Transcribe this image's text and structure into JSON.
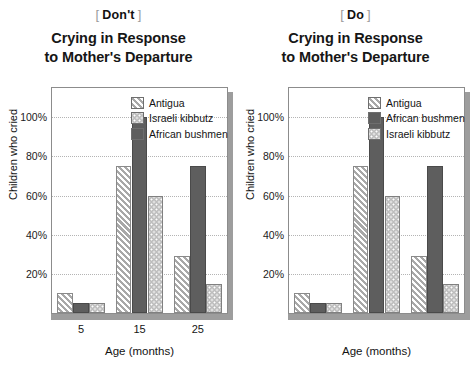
{
  "panels": [
    {
      "tag": {
        "open_bracket": "[",
        "word": "Don't",
        "close_bracket": "]"
      },
      "title_line1": "Crying in Response",
      "title_line2": "to Mother's Departure",
      "legend_order": [
        "Antigua",
        "Israeli kibbutz",
        "African bushmen"
      ]
    },
    {
      "tag": {
        "open_bracket": "[",
        "word": "Do",
        "close_bracket": "]"
      },
      "title_line1": "Crying in Response",
      "title_line2": "to Mother's Departure",
      "legend_order": [
        "Antigua",
        "African bushmen",
        "Israeli kibbutz"
      ]
    }
  ],
  "chart_data": [
    {
      "type": "bar",
      "title": "Crying in Response to Mother's Departure",
      "panel_tag": "Don't",
      "xlabel": "Age (months)",
      "ylabel": "Children who cried",
      "categories": [
        "5",
        "15",
        "25"
      ],
      "ytick_labels": [
        "20%",
        "40%",
        "60%",
        "80%",
        "100%"
      ],
      "ytick_values": [
        20,
        40,
        60,
        80,
        100
      ],
      "ylim": [
        0,
        115
      ],
      "grid": true,
      "legend_position": "inside-top-right",
      "series": [
        {
          "name": "Antigua",
          "values": [
            10,
            75,
            29
          ],
          "pattern": "diagonal-stripes",
          "color": "#e2e2e2"
        },
        {
          "name": "African bushmen",
          "values": [
            5,
            100,
            75
          ],
          "pattern": "solid",
          "color": "#5e5e5e"
        },
        {
          "name": "Israeli kibbutz",
          "values": [
            5,
            60,
            15
          ],
          "pattern": "dots",
          "color": "#bdbdbd"
        }
      ],
      "legend_entries": [
        "Antigua",
        "Israeli kibbutz",
        "African bushmen"
      ]
    },
    {
      "type": "bar",
      "title": "Crying in Response to Mother's Departure",
      "panel_tag": "Do",
      "xlabel": "Age (months)",
      "ylabel": "Children who cried",
      "categories": [
        "5",
        "15",
        "25"
      ],
      "ytick_labels": [
        "20%",
        "40%",
        "60%",
        "80%",
        "100%"
      ],
      "ytick_values": [
        20,
        40,
        60,
        80,
        100
      ],
      "ylim": [
        0,
        115
      ],
      "grid": true,
      "legend_position": "inside-top-right",
      "series": [
        {
          "name": "Antigua",
          "values": [
            10,
            75,
            29
          ],
          "pattern": "diagonal-stripes",
          "color": "#e2e2e2"
        },
        {
          "name": "African bushmen",
          "values": [
            5,
            100,
            75
          ],
          "pattern": "solid",
          "color": "#5e5e5e"
        },
        {
          "name": "Israeli kibbutz",
          "values": [
            5,
            60,
            15
          ],
          "pattern": "dots",
          "color": "#bdbdbd"
        }
      ],
      "legend_entries": [
        "Antigua",
        "African bushmen",
        "Israeli kibbutz"
      ]
    }
  ]
}
